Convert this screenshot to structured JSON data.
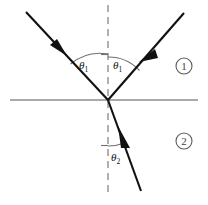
{
  "figure": {
    "background_color": "#ffffff",
    "width": 208,
    "height": 205
  },
  "geometry": {
    "origin": {
      "x": 108,
      "y": 100
    },
    "interface": {
      "x1": 10,
      "y1": 100,
      "x2": 198,
      "y2": 100,
      "color": "#8c8c8c"
    },
    "normal": {
      "x1": 108,
      "y1": 5,
      "x2": 108,
      "y2": 195,
      "color": "#8f8f8f",
      "style": "dashed"
    }
  },
  "rays": [
    {
      "name": "incident-ray",
      "label": "incident ray",
      "from": {
        "x": 26,
        "y": 12
      },
      "to": {
        "x": 108,
        "y": 100
      },
      "arrow_at": {
        "x": 60,
        "y": 48
      },
      "color": "#111111"
    },
    {
      "name": "reflected-ray",
      "label": "reflected ray",
      "from": {
        "x": 108,
        "y": 100
      },
      "to": {
        "x": 184,
        "y": 13
      },
      "arrow_at": {
        "x": 147,
        "y": 55
      },
      "color": "#111111"
    },
    {
      "name": "refracted-ray",
      "label": "refracted ray",
      "from": {
        "x": 108,
        "y": 100
      },
      "to": {
        "x": 141,
        "y": 191
      },
      "arrow_at": {
        "x": 124,
        "y": 143
      },
      "color": "#111111"
    }
  ],
  "angles": [
    {
      "name": "angle-of-incidence",
      "symbol": "θ",
      "subscript": "1",
      "label_x": 80,
      "label_y": 68,
      "arc_radius": 45
    },
    {
      "name": "angle-of-reflection",
      "symbol": "θ",
      "subscript": "1",
      "label_x": 114,
      "label_y": 68,
      "arc_radius": 42
    },
    {
      "name": "angle-of-refraction",
      "symbol": "θ",
      "subscript": "2",
      "label_x": 112,
      "label_y": 160,
      "arc_radius": 46
    }
  ],
  "regions": [
    {
      "name": "region-one",
      "label": "1",
      "marker": "①",
      "x": 184,
      "y": 66
    },
    {
      "name": "region-two",
      "label": "2",
      "marker": "②",
      "x": 184,
      "y": 141
    }
  ]
}
